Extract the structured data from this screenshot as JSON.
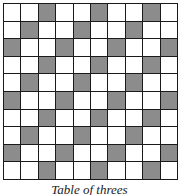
{
  "figure": {
    "caption": "Table of threes",
    "grid": {
      "rows": 10,
      "cols": 10,
      "shaded_rule": "(row + col) mod 3 == 2 (0-indexed)",
      "shaded_color": "#8c8c8c",
      "unshaded_color": "#ffffff",
      "line_color": "#1a1a1a",
      "cells": [
        [
          0,
          0,
          1,
          0,
          0,
          1,
          0,
          0,
          1,
          0
        ],
        [
          0,
          1,
          0,
          0,
          1,
          0,
          0,
          1,
          0,
          0
        ],
        [
          1,
          0,
          0,
          1,
          0,
          0,
          1,
          0,
          0,
          1
        ],
        [
          0,
          0,
          1,
          0,
          0,
          1,
          0,
          0,
          1,
          0
        ],
        [
          0,
          1,
          0,
          0,
          1,
          0,
          0,
          1,
          0,
          0
        ],
        [
          1,
          0,
          0,
          1,
          0,
          0,
          1,
          0,
          0,
          1
        ],
        [
          0,
          0,
          1,
          0,
          0,
          1,
          0,
          0,
          1,
          0
        ],
        [
          0,
          1,
          0,
          0,
          1,
          0,
          0,
          1,
          0,
          0
        ],
        [
          1,
          0,
          0,
          1,
          0,
          0,
          1,
          0,
          0,
          1
        ],
        [
          0,
          0,
          1,
          0,
          0,
          1,
          0,
          0,
          1,
          0
        ]
      ]
    }
  }
}
